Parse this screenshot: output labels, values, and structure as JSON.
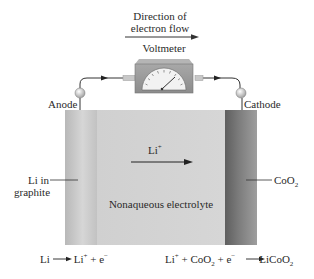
{
  "header": {
    "direction_line1": "Direction of",
    "direction_line2": "electron flow",
    "voltmeter_label": "Voltmeter"
  },
  "electrodes": {
    "anode_label": "Anode",
    "cathode_label": "Cathode",
    "electron_symbol": "e⁻",
    "anode_material_line1": "Li in",
    "anode_material_line2": "graphite",
    "cathode_material_base": "CoO",
    "cathode_material_sub": "2"
  },
  "cell": {
    "ion_label": "Li",
    "ion_charge": "+",
    "electrolyte_label": "Nonaqueous electrolyte"
  },
  "reactions": {
    "anode": {
      "left": "Li",
      "arrow": "⟶",
      "right_ion": "Li",
      "right_ion_charge": "+",
      "right_rest": " + e",
      "right_electron_charge": "−"
    },
    "cathode": {
      "p1": "Li",
      "p1_charge": "+",
      "p2": " + CoO",
      "p2_sub": "2",
      "p3": " + e",
      "p3_charge": "−",
      "arrow": "⟶",
      "product": "LiCoO",
      "product_sub": "2"
    }
  },
  "colors": {
    "anode_strip": "#c4c4c4",
    "electrolyte": "#d3d3d3",
    "cathode_strip": "#6e6e6e",
    "wire": "#333333",
    "voltmeter_body": "#9a9a9a"
  }
}
